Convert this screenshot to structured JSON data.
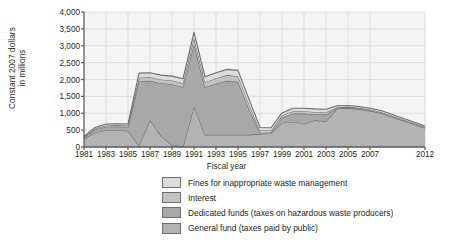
{
  "chart_data": {
    "type": "area",
    "stacked": true,
    "title": "",
    "xlabel": "Fiscal year",
    "ylabel": "Constant 2007 dollars in millions",
    "ylabel_lines": [
      "Constant 2007 dollars",
      "in millions"
    ],
    "ylim": [
      0,
      4000
    ],
    "ytick_values": [
      0,
      500,
      1000,
      1500,
      2000,
      2500,
      3000,
      3500,
      4000
    ],
    "ytick_labels": [
      "0",
      "500",
      "1,000",
      "1,500",
      "2,000",
      "2,500",
      "3,000",
      "3,500",
      "4,000"
    ],
    "xlim": [
      1981,
      2012
    ],
    "xtick_values": [
      1981,
      1983,
      1985,
      1987,
      1989,
      1991,
      1993,
      1995,
      1997,
      1999,
      2001,
      2003,
      2005,
      2007,
      2012
    ],
    "xtick_labels": [
      "1981",
      "1983",
      "1985",
      "1987",
      "1989",
      "1991",
      "1993",
      "1995",
      "1997",
      "1999",
      "2001",
      "2003",
      "2005",
      "2007",
      "2012"
    ],
    "grid": true,
    "legend_position": "below",
    "x": [
      1981,
      1982,
      1983,
      1984,
      1985,
      1986,
      1987,
      1988,
      1989,
      1990,
      1991,
      1992,
      1993,
      1994,
      1995,
      1996,
      1997,
      1998,
      1999,
      2000,
      2001,
      2002,
      2003,
      2004,
      2005,
      2006,
      2007,
      2008,
      2012
    ],
    "series": [
      {
        "name": "General fund (taxes paid by public)",
        "color": "#b3b3b3",
        "values": [
          240,
          430,
          500,
          500,
          480,
          40,
          800,
          330,
          60,
          20,
          1190,
          360,
          360,
          360,
          360,
          360,
          390,
          400,
          720,
          750,
          680,
          790,
          760,
          1140,
          1150,
          1120,
          1070,
          1000,
          560
        ]
      },
      {
        "name": "Dedicated funds (taxes on hazardous waste producers)",
        "color": "#a8a8a8",
        "values": [
          40,
          90,
          100,
          110,
          120,
          1900,
          1160,
          1560,
          1800,
          1760,
          1860,
          1410,
          1520,
          1600,
          1570,
          760,
          30,
          30,
          150,
          240,
          310,
          180,
          200,
          10,
          10,
          10,
          10,
          10,
          10
        ]
      },
      {
        "name": "Interest",
        "color": "#c2c2c2",
        "values": [
          10,
          30,
          40,
          40,
          40,
          110,
          110,
          110,
          110,
          110,
          180,
          150,
          160,
          170,
          170,
          150,
          70,
          60,
          60,
          70,
          70,
          70,
          70,
          30,
          30,
          30,
          30,
          30,
          20
        ]
      },
      {
        "name": "Fines for inappropriate waste management",
        "color": "#dcdcdc",
        "values": [
          20,
          30,
          40,
          40,
          40,
          140,
          130,
          130,
          130,
          130,
          170,
          160,
          160,
          170,
          170,
          150,
          90,
          80,
          80,
          90,
          90,
          90,
          90,
          40,
          40,
          40,
          40,
          40,
          30
        ]
      }
    ],
    "totals": [
      310,
      580,
      680,
      690,
      680,
      2190,
      2200,
      2130,
      2100,
      2020,
      3400,
      2080,
      2200,
      2300,
      2270,
      1420,
      580,
      570,
      1010,
      1150,
      1150,
      1130,
      1120,
      1220,
      1230,
      1200,
      1150,
      1080,
      620
    ]
  },
  "legend": {
    "items": [
      {
        "label": "Fines for inappropriate waste management",
        "color": "#dcdcdc"
      },
      {
        "label": "Interest",
        "color": "#c2c2c2"
      },
      {
        "label": "Dedicated funds (taxes on hazardous waste producers)",
        "color": "#a8a8a8"
      },
      {
        "label": "General fund (taxes paid by public)",
        "color": "#b3b3b3"
      }
    ]
  },
  "style": {
    "plot_bg": "#f4f4f4",
    "grid_color": "#dcdcdc",
    "axis_color": "#58595b",
    "line_color": "#6e6e6e"
  }
}
